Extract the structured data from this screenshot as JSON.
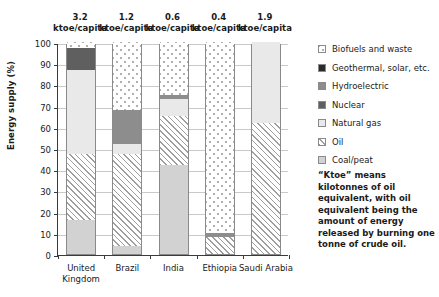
{
  "chart_data": {
    "type": "bar",
    "subtype": "stacked-bar-100-percent",
    "title": "",
    "xlabel": "",
    "ylabel": "Energy supply (%)",
    "ylim": [
      0,
      100
    ],
    "ytick_step": 10,
    "yticks": [
      0,
      10,
      20,
      30,
      40,
      50,
      60,
      70,
      80,
      90,
      100
    ],
    "grid": true,
    "legend_position": "right",
    "categories": [
      "United Kingdom",
      "Brazil",
      "India",
      "Ethiopia",
      "Saudi Arabia"
    ],
    "category_annotations": [
      {
        "value": "3.2",
        "unit": "ktoe/capita"
      },
      {
        "value": "1.2",
        "unit": "ktoe/capita"
      },
      {
        "value": "0.6",
        "unit": "ktoe/capita"
      },
      {
        "value": "0.4",
        "unit": "ktoe/capita"
      },
      {
        "value": "1.9",
        "unit": "ktoe/capita"
      }
    ],
    "series": [
      {
        "name": "Coal/peat",
        "key": "coal",
        "values": [
          16,
          4,
          42,
          0,
          0
        ]
      },
      {
        "name": "Oil",
        "key": "oil",
        "values": [
          31,
          43,
          23,
          8,
          62
        ]
      },
      {
        "name": "Natural gas",
        "key": "gas",
        "values": [
          40,
          5,
          8,
          0,
          38
        ]
      },
      {
        "name": "Nuclear",
        "key": "nuclear",
        "values": [
          10,
          0,
          0,
          0,
          0
        ]
      },
      {
        "name": "Hydroelectric",
        "key": "hydro",
        "values": [
          0,
          16,
          2,
          2,
          0
        ]
      },
      {
        "name": "Geothermal, solar, etc.",
        "key": "geo",
        "values": [
          0,
          0,
          0,
          0,
          0
        ]
      },
      {
        "name": "Biofuels and waste",
        "key": "bio",
        "values": [
          3,
          32,
          25,
          90,
          0
        ]
      }
    ],
    "legend_entries": [
      {
        "label": "Biofuels and waste",
        "key": "bio"
      },
      {
        "label": "Geothermal, solar, etc.",
        "key": "geo"
      },
      {
        "label": "Hydroelectric",
        "key": "hydro"
      },
      {
        "label": "Nuclear",
        "key": "nuclear"
      },
      {
        "label": "Natural gas",
        "key": "gas"
      },
      {
        "label": "Oil",
        "key": "oil"
      },
      {
        "label": "Coal/peat",
        "key": "coal"
      }
    ],
    "note": "“Ktoe” means kilotonnes of oil equivalent, with oil equivalent being the amount of energy released by burning one tonne of crude oil."
  },
  "colors": {
    "coal": "#d2d2d2",
    "oil": "#ffffff",
    "gas": "#e9e9e9",
    "nuclear": "#5f5f5f",
    "hydro": "#8d8d8d",
    "geo": "#2b2b2b",
    "bio": "#ffffff",
    "axis": "#3a3a3a",
    "grid": "#c9c9c9"
  }
}
